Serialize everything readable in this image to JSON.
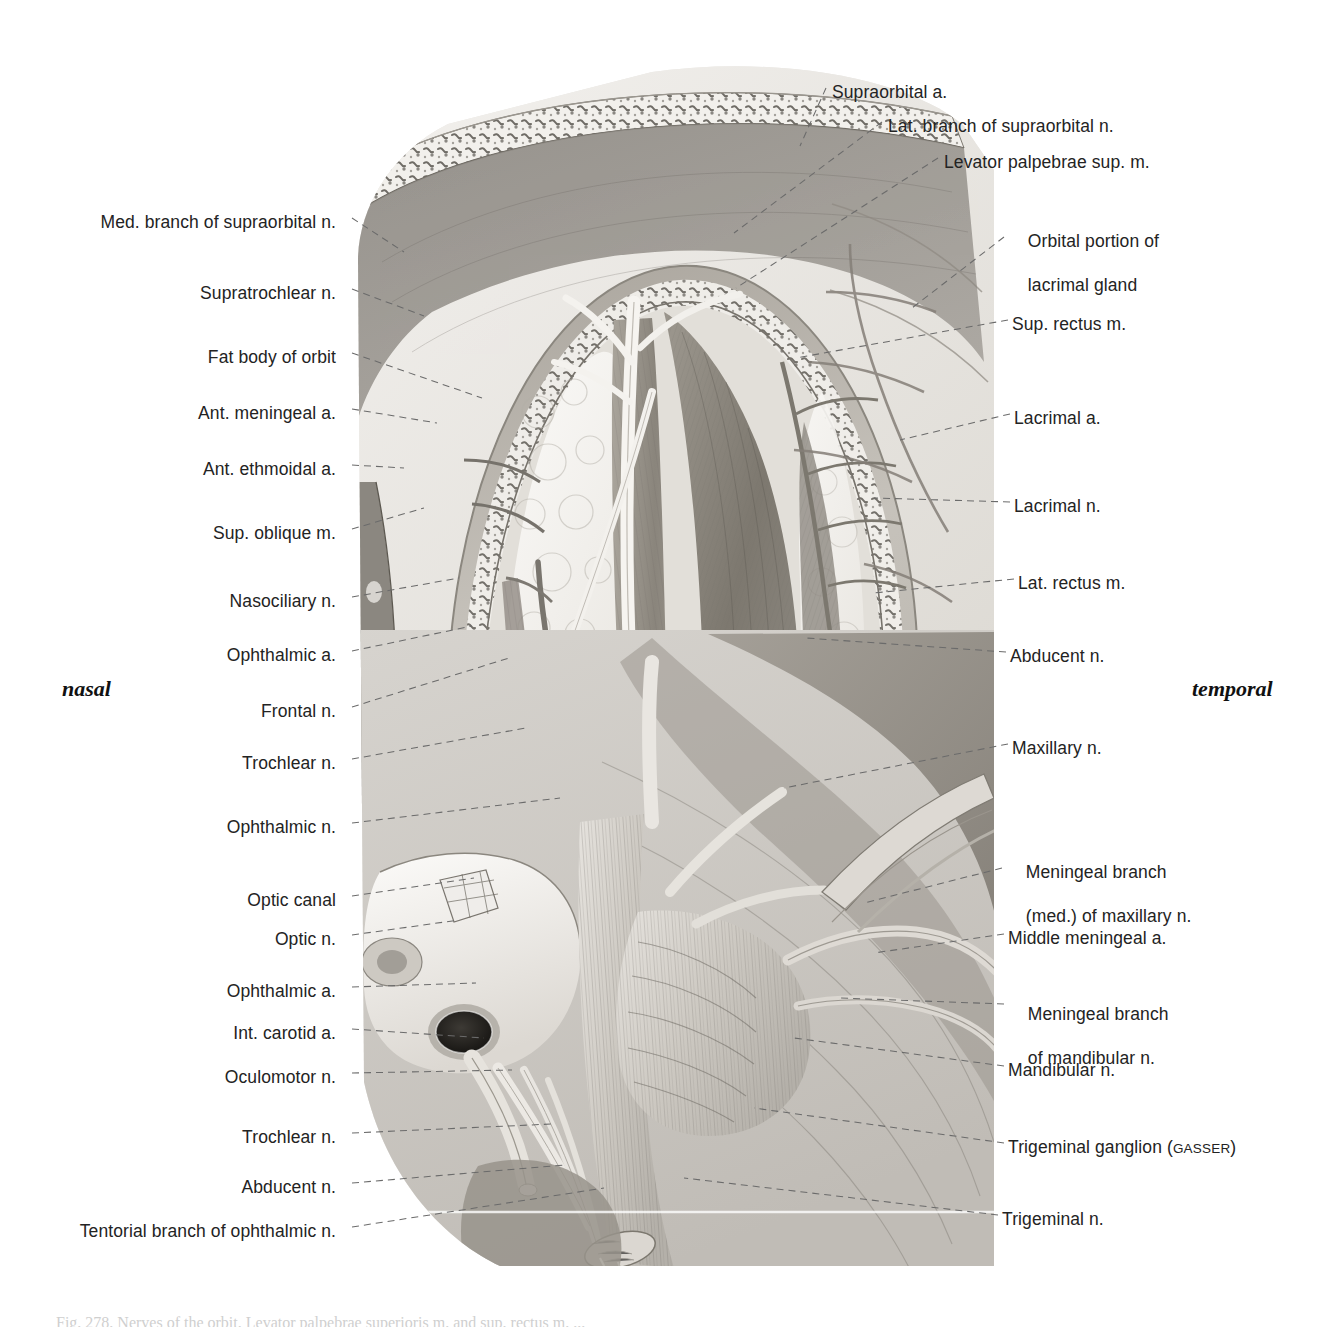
{
  "figure": {
    "type": "anatomical-illustration",
    "orientation": {
      "left": "nasal",
      "right": "temporal"
    }
  },
  "labels_left": [
    {
      "text": "Med. branch of supraorbital n.",
      "x": 348,
      "y": 222,
      "tx": 400,
      "ty": 255
    },
    {
      "text": "Supratrochlear n.",
      "x": 348,
      "y": 293,
      "tx": 420,
      "ty": 318
    },
    {
      "text": "Fat body of orbit",
      "x": 348,
      "y": 357,
      "tx": 480,
      "ty": 400
    },
    {
      "text": "Ant. meningeal a.",
      "x": 348,
      "y": 413,
      "tx": 433,
      "ty": 425
    },
    {
      "text": "Ant. ethmoidal a.",
      "x": 348,
      "y": 469,
      "tx": 400,
      "ty": 470
    },
    {
      "text": "Sup. oblique m.",
      "x": 348,
      "y": 533,
      "tx": 420,
      "ty": 510
    },
    {
      "text": "Nasociliary n.",
      "x": 348,
      "y": 601,
      "tx": 455,
      "ty": 580
    },
    {
      "text": "Ophthalmic a.",
      "x": 348,
      "y": 655,
      "tx": 468,
      "ty": 628
    },
    {
      "text": "Frontal n.",
      "x": 348,
      "y": 711,
      "tx": 505,
      "ty": 660
    },
    {
      "text": "Trochlear n.",
      "x": 348,
      "y": 763,
      "tx": 522,
      "ty": 730
    },
    {
      "text": "Ophthalmic n.",
      "x": 348,
      "y": 827,
      "tx": 556,
      "ty": 800
    },
    {
      "text": "Optic canal",
      "x": 348,
      "y": 900,
      "tx": 470,
      "ty": 880
    },
    {
      "text": "Optic n.",
      "x": 348,
      "y": 939,
      "tx": 455,
      "ty": 922
    },
    {
      "text": "Ophthalmic a.",
      "x": 348,
      "y": 991,
      "tx": 472,
      "ty": 985
    },
    {
      "text": "Int. carotid a.",
      "x": 348,
      "y": 1033,
      "tx": 480,
      "ty": 1040
    },
    {
      "text": "Oculomotor n.",
      "x": 348,
      "y": 1077,
      "tx": 508,
      "ty": 1072
    },
    {
      "text": "Trochlear n.",
      "x": 348,
      "y": 1137,
      "tx": 548,
      "ty": 1126
    },
    {
      "text": "Abducent n.",
      "x": 348,
      "y": 1187,
      "tx": 560,
      "ty": 1167
    },
    {
      "text": "Tentorial branch of ophthalmic n.",
      "x": 348,
      "y": 1231,
      "tx": 600,
      "ty": 1190
    }
  ],
  "labels_right": [
    {
      "text": "Supraorbital a.",
      "x": 832,
      "y": 92,
      "tx": 806,
      "ty": 148
    },
    {
      "text": "Lat. branch of supraorbital n.",
      "x": 888,
      "y": 126,
      "tx": 740,
      "ty": 235
    },
    {
      "text": "Levator palpebrae sup. m.",
      "x": 944,
      "y": 162,
      "tx": 742,
      "ty": 290
    },
    {
      "text": "Orbital portion of",
      "x": 1008,
      "y": 219,
      "tx": 920,
      "ty": 310,
      "line2": "lacrimal gland",
      "y2": 243
    },
    {
      "text": "Sup. rectus m.",
      "x": 1012,
      "y": 324,
      "tx": 800,
      "ty": 360
    },
    {
      "text": "Lacrimal a.",
      "x": 1014,
      "y": 418,
      "tx": 905,
      "ty": 442
    },
    {
      "text": "Lacrimal n.",
      "x": 1014,
      "y": 506,
      "tx": 880,
      "ty": 500
    },
    {
      "text": "Lat. rectus m.",
      "x": 1018,
      "y": 583,
      "tx": 880,
      "ty": 595
    },
    {
      "text": "Abducent n.",
      "x": 1010,
      "y": 656,
      "tx": 812,
      "ty": 640
    },
    {
      "text": "Maxillary n.",
      "x": 1012,
      "y": 748,
      "tx": 790,
      "ty": 790
    },
    {
      "text": "Meningeal branch",
      "x": 1006,
      "y": 850,
      "tx": 870,
      "ty": 905,
      "line2": "(med.) of maxillary n.",
      "y2": 874
    },
    {
      "text": "Middle meningeal a.",
      "x": 1008,
      "y": 938,
      "tx": 880,
      "ty": 955
    },
    {
      "text": "Meningeal branch",
      "x": 1008,
      "y": 992,
      "tx": 845,
      "ty": 1000,
      "line2": "of mandibular n.",
      "y2": 1016
    },
    {
      "text": "Mandibular n.",
      "x": 1008,
      "y": 1070,
      "tx": 800,
      "ty": 1040
    },
    {
      "text": "Trigeminal ganglion (",
      "x": 1008,
      "y": 1147,
      "smallcaps": "GASSER",
      "suffix": ")",
      "tx": 760,
      "ty": 1110
    },
    {
      "text": "Trigeminal n.",
      "x": 1002,
      "y": 1219,
      "tx": 690,
      "ty": 1180
    }
  ],
  "orientation_labels": [
    {
      "text": "nasal",
      "x": 62,
      "y": 678
    },
    {
      "text": "temporal",
      "x": 1192,
      "y": 678
    }
  ],
  "caption": "Fig. 278. Nerves of the orbit. Levator palpebrae superioris m. and sup. rectus m. ...",
  "colors": {
    "background": "#ffffff",
    "ink": "#232323",
    "leader": "#6b6b6b",
    "plate_light": "#e8e6e2",
    "plate_mid": "#b9b5ae",
    "plate_dark": "#8d8982",
    "plate_darker": "#6e6a64"
  }
}
